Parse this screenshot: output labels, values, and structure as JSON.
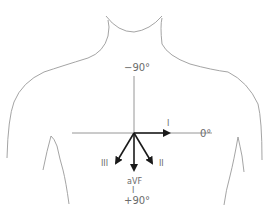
{
  "diagram": {
    "axis_labels": {
      "top": "−90°",
      "right": "0°",
      "bottom": "+90°"
    },
    "leads": [
      {
        "label": "I",
        "angle_deg": 0
      },
      {
        "label": "II",
        "angle_deg": 60
      },
      {
        "label": "III",
        "angle_deg": 120
      },
      {
        "label": "aVF",
        "angle_deg": 90
      }
    ],
    "avf_tick": "I",
    "colors": {
      "outline": "#9a9a9a",
      "axis": "#8a8a8a",
      "vector": "#1a1a1a",
      "text": "#6b6b6b"
    }
  }
}
